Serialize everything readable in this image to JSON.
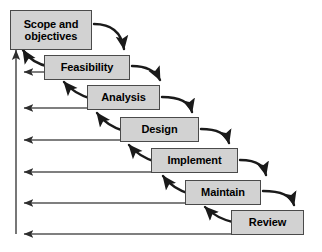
{
  "diagram": {
    "type": "flow-diagram",
    "canvas": {
      "width": 322,
      "height": 252
    },
    "colors": {
      "box_fill": "#d2d2d2",
      "box_border": "#4a4a4a",
      "arrow": "#1a1a1a",
      "feedback_line": "#555555",
      "background": "#ffffff",
      "text": "#000000"
    },
    "stages": [
      {
        "id": "scope-and-objectives",
        "label": "Scope and\nobjectives",
        "order": 1,
        "x": 10,
        "y": 10,
        "width": 82,
        "height": 40,
        "font_size": 11
      },
      {
        "id": "feasibility",
        "label": "Feasibility",
        "order": 2,
        "x": 44,
        "y": 55,
        "width": 86,
        "height": 25,
        "font_size": 11
      },
      {
        "id": "analysis",
        "label": "Analysis",
        "order": 3,
        "x": 87,
        "y": 85,
        "width": 73,
        "height": 25,
        "font_size": 11
      },
      {
        "id": "design",
        "label": "Design",
        "order": 4,
        "x": 120,
        "y": 117,
        "width": 79,
        "height": 25,
        "font_size": 11
      },
      {
        "id": "implement",
        "label": "Implement",
        "order": 5,
        "x": 151,
        "y": 148,
        "width": 87,
        "height": 25,
        "font_size": 11
      },
      {
        "id": "maintain",
        "label": "Maintain",
        "order": 6,
        "x": 185,
        "y": 180,
        "width": 76,
        "height": 25,
        "font_size": 11
      },
      {
        "id": "review",
        "label": "Review",
        "order": 7,
        "x": 231,
        "y": 210,
        "width": 73,
        "height": 25,
        "font_size": 11
      }
    ],
    "forward_arrows": [
      {
        "id": "scope-to-feasibility",
        "from": "scope-and-objectives",
        "to": "feasibility"
      },
      {
        "id": "feasibility-to-analysis",
        "from": "feasibility",
        "to": "analysis"
      },
      {
        "id": "analysis-to-design",
        "from": "analysis",
        "to": "design"
      },
      {
        "id": "design-to-implement",
        "from": "design",
        "to": "implement"
      },
      {
        "id": "implement-to-maintain",
        "from": "implement",
        "to": "maintain"
      },
      {
        "id": "maintain-to-review",
        "from": "maintain",
        "to": "review"
      }
    ],
    "backward_arrows": [
      {
        "id": "feasibility-to-scope",
        "from": "feasibility",
        "to": "scope-and-objectives"
      },
      {
        "id": "analysis-to-feasibility",
        "from": "analysis",
        "to": "feasibility"
      },
      {
        "id": "design-to-analysis",
        "from": "design",
        "to": "analysis"
      },
      {
        "id": "implement-to-design",
        "from": "implement",
        "to": "design"
      },
      {
        "id": "maintain-to-implement",
        "from": "maintain",
        "to": "implement"
      },
      {
        "id": "review-to-maintain",
        "from": "review",
        "to": "maintain"
      }
    ],
    "feedback_lines": [
      {
        "id": "feedback-from-feasibility",
        "from": "feasibility",
        "y": 72,
        "start_x": 44
      },
      {
        "id": "feedback-from-analysis",
        "from": "analysis",
        "y": 108,
        "start_x": 87
      },
      {
        "id": "feedback-from-design",
        "from": "design",
        "y": 140,
        "start_x": 120
      },
      {
        "id": "feedback-from-implement",
        "from": "implement",
        "y": 172,
        "start_x": 151
      },
      {
        "id": "feedback-from-maintain",
        "from": "maintain",
        "y": 203,
        "start_x": 185
      },
      {
        "id": "feedback-from-review",
        "from": "review",
        "y": 234,
        "start_x": 231
      }
    ],
    "spine": {
      "id": "feedback-spine",
      "x": 16,
      "top_y": 46,
      "bottom_y": 234
    }
  }
}
